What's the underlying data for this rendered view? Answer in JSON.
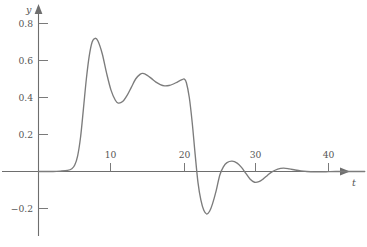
{
  "chart_data": {
    "type": "line",
    "title": "",
    "subtitle": "",
    "xlabel": "t",
    "ylabel": "y",
    "xlim": [
      -1,
      45
    ],
    "ylim": [
      -0.3,
      0.9
    ],
    "grid": false,
    "legend": null,
    "x_ticks": [
      {
        "value": 10,
        "label": "10"
      },
      {
        "value": 20,
        "label": "20"
      },
      {
        "value": 30,
        "label": "30"
      },
      {
        "value": 40,
        "label": "40"
      }
    ],
    "y_ticks": [
      {
        "value": 0.8,
        "label": "0.8"
      },
      {
        "value": 0.6,
        "label": "0.6"
      },
      {
        "value": 0.4,
        "label": "0.4"
      },
      {
        "value": 0.2,
        "label": "0.2"
      },
      {
        "value": -0.2,
        "label": "−0.2"
      }
    ],
    "series": [
      {
        "name": "y(t)",
        "color": "#7c7c7c",
        "x": [
          0,
          1,
          2,
          3,
          4,
          4.6,
          5.0,
          5.4,
          5.8,
          6.2,
          6.6,
          7.0,
          7.4,
          7.8,
          8.2,
          8.8,
          9.4,
          10.0,
          10.6,
          11.0,
          11.6,
          12.2,
          12.8,
          13.4,
          14.0,
          14.4,
          15.0,
          15.6,
          16.2,
          16.8,
          17.4,
          18.0,
          18.6,
          19.2,
          19.8,
          20.1,
          20.4,
          20.8,
          21.2,
          21.6,
          22.0,
          22.4,
          22.8,
          23.2,
          23.6,
          24.0,
          24.5,
          25.0,
          25.5,
          26.0,
          26.7,
          27.4,
          28.0,
          28.6,
          29.2,
          29.8,
          30.4,
          31.0,
          31.6,
          32.2,
          33.0,
          33.8,
          34.6,
          35.4,
          36.2,
          37.0,
          38.0,
          39.0,
          40.0,
          41.0,
          42.0,
          43.0,
          44.0,
          45.0
        ],
        "y": [
          0,
          0,
          0,
          0.002,
          0.006,
          0.015,
          0.035,
          0.085,
          0.185,
          0.34,
          0.5,
          0.625,
          0.7,
          0.72,
          0.705,
          0.635,
          0.53,
          0.44,
          0.385,
          0.37,
          0.378,
          0.41,
          0.455,
          0.5,
          0.525,
          0.53,
          0.52,
          0.502,
          0.483,
          0.47,
          0.463,
          0.465,
          0.473,
          0.485,
          0.496,
          0.5,
          0.48,
          0.4,
          0.265,
          0.095,
          -0.06,
          -0.155,
          -0.21,
          -0.23,
          -0.215,
          -0.175,
          -0.105,
          -0.02,
          0.025,
          0.048,
          0.056,
          0.045,
          0.022,
          -0.01,
          -0.042,
          -0.058,
          -0.055,
          -0.04,
          -0.02,
          -0.002,
          0.013,
          0.018,
          0.014,
          0.008,
          0.003,
          0.0,
          -0.002,
          -0.002,
          -0.001,
          0.0,
          0.0,
          0.0,
          0.0,
          0.0
        ]
      }
    ],
    "annotations": [],
    "axis_origin_label": "0"
  },
  "figure": {
    "axis_color": "#6e6e6e",
    "tick_color": "#7a7a7a",
    "text_color": "#555555",
    "curve_color": "#7c7c7c",
    "background": "#ffffff"
  }
}
